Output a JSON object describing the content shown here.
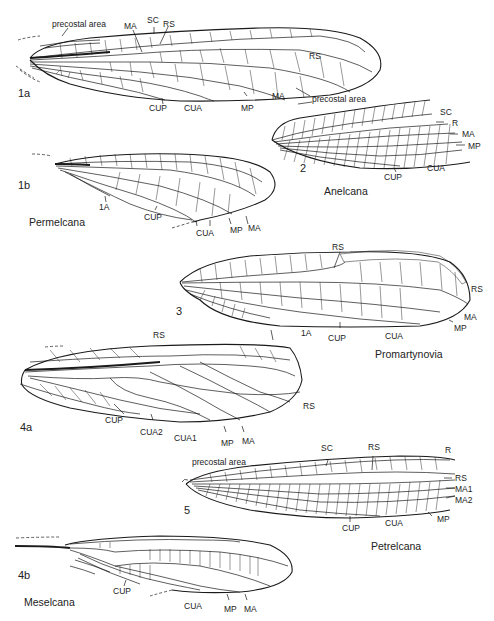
{
  "figure": {
    "panels": [
      {
        "id": "1a",
        "number": "1a",
        "taxon": "",
        "labels": {
          "precostal": "precostal area",
          "ma_top": "MA",
          "sc": "SC",
          "rs_top": "RS",
          "rs_right": "RS",
          "cup": "CUP",
          "cua": "CUA",
          "mp": "MP",
          "ma": "MA"
        }
      },
      {
        "id": "2",
        "number": "2",
        "taxon": "Anelcana",
        "labels": {
          "precostal": "precostal area",
          "sc": "SC",
          "r": "R",
          "ma": "MA",
          "mp": "MP",
          "cup": "CUP",
          "cua": "CUA"
        }
      },
      {
        "id": "1b",
        "number": "1b",
        "taxon": "Permelcana",
        "labels": {
          "a1": "1A",
          "cup": "CUP",
          "cua": "CUA",
          "mp": "MP",
          "ma": "MA"
        }
      },
      {
        "id": "3",
        "number": "3",
        "taxon": "Promartynovia",
        "labels": {
          "rs_top": "RS",
          "rs_right": "RS",
          "ma": "MA",
          "mp": "MP",
          "a1": "1A",
          "cup": "CUP",
          "cua": "CUA"
        }
      },
      {
        "id": "4a",
        "number": "4a",
        "taxon": "",
        "labels": {
          "rs_top": "RS",
          "rs_right": "RS",
          "cup": "CUP",
          "cua2": "CUA2",
          "cua1": "CUA1",
          "mp": "MP",
          "ma": "MA"
        }
      },
      {
        "id": "5",
        "number": "5",
        "taxon": "Petrelcana",
        "labels": {
          "precostal": "precostal area",
          "sc": "SC",
          "rs_top": "RS",
          "r": "R",
          "rs_right": "RS",
          "ma1": "MA1",
          "ma2": "MA2",
          "mp": "MP",
          "cup": "CUP",
          "cua": "CUA"
        }
      },
      {
        "id": "4b",
        "number": "4b",
        "taxon": "Meselcana",
        "labels": {
          "cup": "CUP",
          "cua": "CUA",
          "mp": "MP",
          "ma": "MA"
        }
      }
    ]
  }
}
